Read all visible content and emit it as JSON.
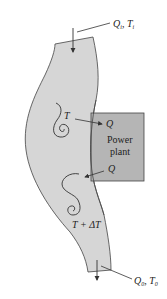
{
  "diagram": {
    "inlet_label": {
      "q": "Q",
      "q_sub": "i",
      "t": "T",
      "t_sub": "i"
    },
    "outlet_label": {
      "q": "Q",
      "q_sub": "0",
      "t": "T",
      "t_sub": "0"
    },
    "upstream_temp": "T",
    "downstream_temp": "T + ΔT",
    "heat_out_label": "Q",
    "heat_in_label": "Q",
    "plant_line1": "Power",
    "plant_line2": "plant"
  },
  "colors": {
    "river_fill": "#d6d6d6",
    "plant_fill": "#b5b5b5",
    "stroke": "#333333"
  }
}
